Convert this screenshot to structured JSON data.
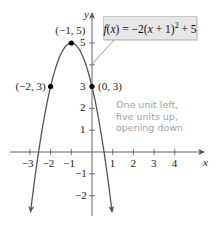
{
  "chart_data": {
    "type": "line",
    "title": "",
    "function": "f(x) = -2(x+1)^2 + 5",
    "equation_label": {
      "prefix": "f(x) = −2(x + 1)",
      "exponent": "2",
      "suffix": " + 5"
    },
    "xlabel": "x",
    "ylabel": "y",
    "xlim": [
      -3.7,
      5.3
    ],
    "ylim": [
      -2.9,
      5.9
    ],
    "x_ticks": [
      -3,
      -2,
      -1,
      1,
      2,
      3,
      4
    ],
    "y_ticks": [
      -2,
      -1,
      1,
      2,
      3,
      4,
      5
    ],
    "x_tick_labels": [
      "−3",
      "−2",
      "−1",
      "1",
      "2",
      "3",
      "4"
    ],
    "y_tick_labels": [
      "−2",
      "−1",
      "1",
      "2",
      "3",
      "",
      "5"
    ],
    "grid": false,
    "series": [
      {
        "name": "f(x) = -2(x+1)^2 + 5",
        "x": [
          -3,
          -2.5,
          -2,
          -1.5,
          -1,
          -0.5,
          0,
          0.5,
          1
        ],
        "y": [
          -3,
          0.5,
          3,
          4.5,
          5,
          4.5,
          3,
          0.5,
          -3
        ],
        "color": "#555555"
      }
    ],
    "points": [
      {
        "x": -1,
        "y": 5,
        "label": "(−1, 5)"
      },
      {
        "x": -2,
        "y": 3,
        "label": "(−2, 3)"
      },
      {
        "x": 0,
        "y": 3,
        "label": "(0, 3)"
      }
    ],
    "annotations": [
      "One unit left,",
      "five units up,",
      "opening down"
    ],
    "annotation_color": "#a3a3a3"
  },
  "labels": {
    "x_axis": "x",
    "y_axis": "y"
  }
}
